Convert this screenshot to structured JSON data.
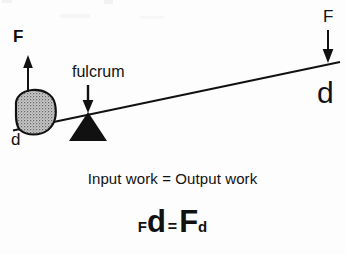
{
  "diagram": {
    "background_color": "#fdfdfd",
    "ink_color": "#111111",
    "labels": {
      "force_left": "F",
      "distance_left": "d",
      "fulcrum": "fulcrum",
      "force_right": "F",
      "distance_right": "d"
    },
    "statement": "Input work = Output work",
    "equation": {
      "left_force": "F",
      "left_distance": "d",
      "equals": "=",
      "right_force": "F",
      "right_distance": "d"
    },
    "shapes": {
      "beam": {
        "name": "lever-beam",
        "x1": 13,
        "y1": 130,
        "x2": 340,
        "y2": 62
      },
      "fulcrum_triangle": {
        "name": "fulcrum-triangle",
        "apex_x": 88,
        "apex_y": 112,
        "left_x": 69,
        "right_x": 107,
        "base_y": 141,
        "fill": "#111111"
      },
      "rock": {
        "name": "rock-load",
        "center_x": 34,
        "center_y": 113,
        "radius_x": 22,
        "radius_y": 20,
        "fill": "#b9b9b9",
        "stroke": "#111111"
      },
      "arrow_up_left": {
        "name": "force-arrow-up-left",
        "x": 28,
        "from_y": 92,
        "to_y": 57
      },
      "arrow_down_fulcrum": {
        "name": "fulcrum-pointer-arrow",
        "x": 88,
        "from_y": 86,
        "to_y": 112
      },
      "arrow_down_right": {
        "name": "force-arrow-down-right",
        "x": 328,
        "from_y": 30,
        "to_y": 63
      }
    }
  }
}
